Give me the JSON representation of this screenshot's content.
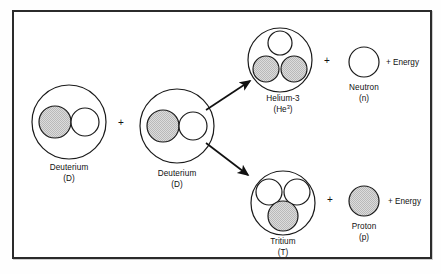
{
  "figure": {
    "frame_color": "#2b2b2b",
    "background_color": "#ffffff"
  },
  "legend": {
    "proton_fill": "#d8d8d8",
    "neutron_fill": "#ffffff",
    "outline_color": "#1a1a1a"
  },
  "reactants": [
    {
      "id": "deuterium-1",
      "name": "Deuterium",
      "symbol": "(D)",
      "particles": [
        {
          "type": "proton",
          "fill": "shaded"
        },
        {
          "type": "neutron",
          "fill": "white"
        }
      ]
    },
    {
      "id": "deuterium-2",
      "name": "Deuterium",
      "symbol": "(D)",
      "particles": [
        {
          "type": "proton",
          "fill": "shaded"
        },
        {
          "type": "neutron",
          "fill": "white"
        }
      ]
    }
  ],
  "operators": {
    "reactant_plus": "+",
    "product_plus_upper": "+",
    "product_plus_lower": "+"
  },
  "products": {
    "upper_branch": {
      "nucleus": {
        "id": "helium-3",
        "name": "Helium-3",
        "symbol_base": "(He",
        "symbol_superscript": "3",
        "symbol_close": ")",
        "particles": [
          {
            "type": "neutron",
            "fill": "white"
          },
          {
            "type": "proton",
            "fill": "shaded"
          },
          {
            "type": "proton",
            "fill": "shaded"
          }
        ]
      },
      "emitted": {
        "id": "neutron",
        "name": "Neutron",
        "symbol": "(n)",
        "fill": "white"
      },
      "energy_label": "+ Energy"
    },
    "lower_branch": {
      "nucleus": {
        "id": "tritium",
        "name": "Tritium",
        "symbol_base": "(T)",
        "particles": [
          {
            "type": "neutron",
            "fill": "white"
          },
          {
            "type": "neutron",
            "fill": "white"
          },
          {
            "type": "proton",
            "fill": "shaded"
          }
        ]
      },
      "emitted": {
        "id": "proton",
        "name": "Proton",
        "symbol": "(p)",
        "fill": "shaded"
      },
      "energy_label": "+ Energy"
    }
  }
}
